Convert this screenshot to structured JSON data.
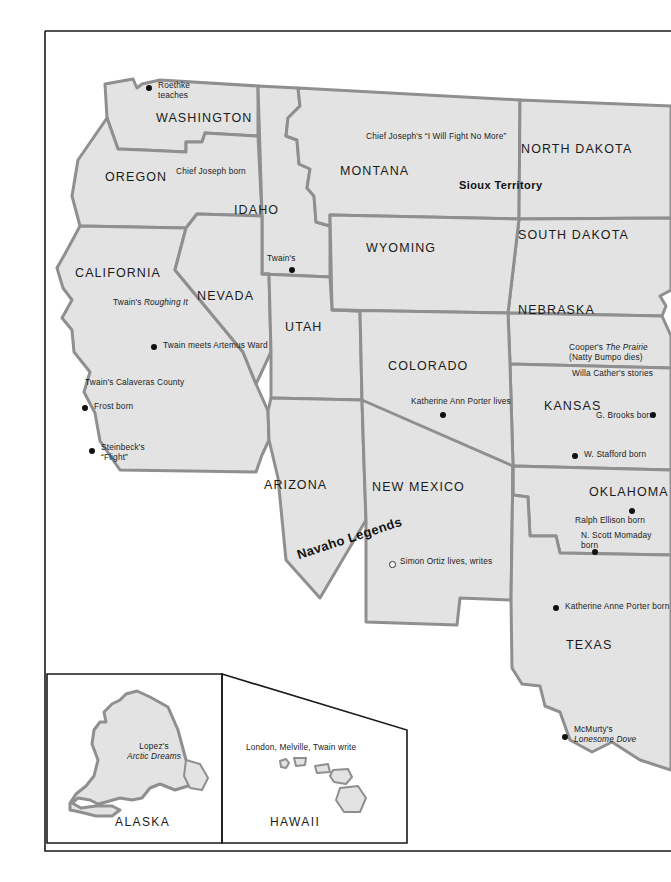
{
  "map": {
    "title": "Literary map of the Western United States",
    "fill_color": "#e3e3e3",
    "border_color": "#8f8f8f",
    "frame_color": "#1a1a1a",
    "states": [
      {
        "id": "washington",
        "label": "WASHINGTON"
      },
      {
        "id": "oregon",
        "label": "OREGON"
      },
      {
        "id": "idaho",
        "label": "IDAHO"
      },
      {
        "id": "montana",
        "label": "MONTANA"
      },
      {
        "id": "north-dakota",
        "label": "NORTH DAKOTA"
      },
      {
        "id": "south-dakota",
        "label": "SOUTH DAKOTA"
      },
      {
        "id": "wyoming",
        "label": "WYOMING"
      },
      {
        "id": "nebraska",
        "label": "NEBRASKA"
      },
      {
        "id": "california",
        "label": "CALIFORNIA"
      },
      {
        "id": "nevada",
        "label": "NEVADA"
      },
      {
        "id": "utah",
        "label": "UTAH"
      },
      {
        "id": "colorado",
        "label": "COLORADO"
      },
      {
        "id": "kansas",
        "label": "KANSAS"
      },
      {
        "id": "arizona",
        "label": "ARIZONA"
      },
      {
        "id": "new-mexico",
        "label": "NEW MEXICO"
      },
      {
        "id": "oklahoma",
        "label": "OKLAHOMA"
      },
      {
        "id": "texas",
        "label": "TEXAS"
      }
    ],
    "territories": [
      {
        "id": "sioux-territory",
        "label": "Sioux Territory"
      },
      {
        "id": "navaho-legends",
        "label": "Navaho Legends"
      }
    ],
    "annotations": [
      {
        "id": "roethke",
        "line1": "Roethke",
        "line2": "teaches",
        "marker": "filled"
      },
      {
        "id": "chief-joseph-born",
        "line1": "Chief Joseph born",
        "marker": "none"
      },
      {
        "id": "chief-joseph-quote",
        "line1": "Chief Joseph's “I Will Fight No More”",
        "marker": "none"
      },
      {
        "id": "ezra-pound",
        "line1": "Ezra Pound born",
        "marker": "filled"
      },
      {
        "id": "twains-roughing-it",
        "line1": "Twain's ",
        "line1_italic": "Roughing It",
        "marker": "none"
      },
      {
        "id": "twain-artemus-ward",
        "line1": "Twain meets Artemus Ward",
        "marker": "filled"
      },
      {
        "id": "twains-calaveras",
        "line1": "Twain's Calaveras County",
        "marker": "none"
      },
      {
        "id": "frost-born",
        "line1": "Frost born",
        "marker": "filled"
      },
      {
        "id": "steinbecks-flight",
        "line1": "Steinbeck's",
        "line2": "“Flight”",
        "marker": "filled"
      },
      {
        "id": "coopers-the-prairie",
        "line1": "Cooper's ",
        "line1_italic": "The Prairie",
        "line2": "(Natty Bumpo dies)",
        "marker": "none"
      },
      {
        "id": "willa-cather",
        "line1": "Willa Cather's stories",
        "marker": "none"
      },
      {
        "id": "g-brooks-born",
        "line1": "G. Brooks born",
        "marker": "filled"
      },
      {
        "id": "w-stafford-born",
        "line1": "W. Stafford born",
        "marker": "filled"
      },
      {
        "id": "katherine-ann-porter-lives",
        "line1": "Katherine Ann Porter lives",
        "marker": "filled"
      },
      {
        "id": "simon-ortiz",
        "line1": "Simon Ortiz lives, writes",
        "marker": "open"
      },
      {
        "id": "ralph-ellison-born",
        "line1": "Ralph Ellison born",
        "marker": "filled"
      },
      {
        "id": "n-scott-momaday",
        "line1": "N. Scott Momaday",
        "line2": "born",
        "marker": "filled"
      },
      {
        "id": "katherine-anne-porter-born",
        "line1": "Katherine Anne Porter born",
        "marker": "filled"
      },
      {
        "id": "mcmurtrys-lonesome-dove",
        "line1": "McMurty's",
        "line2_italic": "Lonesome Dove",
        "marker": "filled"
      }
    ],
    "insets": [
      {
        "id": "alaska",
        "label": "ALASKA",
        "note_line1": "Lopez's",
        "note_line2_italic": "Arctic Dreams"
      },
      {
        "id": "hawaii",
        "label": "HAWAII",
        "note_line1": "London, Melville, Twain write"
      }
    ]
  }
}
